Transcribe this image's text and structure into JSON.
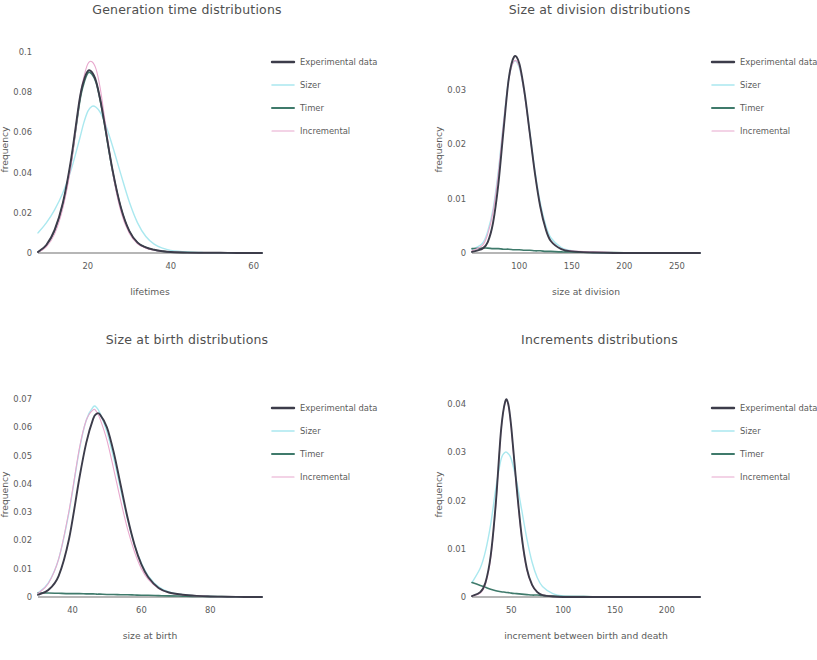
{
  "figure": {
    "series_names": [
      "Experimental data",
      "Sizer",
      "Timer",
      "Incremental"
    ],
    "colors": {
      "experimental": "#3c3c4a",
      "sizer": "#aae8ef",
      "timer": "#3f7a6b",
      "incremental": "#e8a8cd",
      "axis": "#6f6f6f",
      "text": "#5b5b5b",
      "background": "#ffffff"
    }
  },
  "panels": [
    {
      "id": "generation-time",
      "title": "Generation time distributions",
      "xlabel": "lifetimes",
      "ylabel": "frequency"
    },
    {
      "id": "size-at-division",
      "title": "Size at division distributions",
      "xlabel": "size at division",
      "ylabel": "frequency"
    },
    {
      "id": "size-at-birth",
      "title": "Size at birth distributions",
      "xlabel": "size at birth",
      "ylabel": "frequency"
    },
    {
      "id": "increments",
      "title": "Increments distributions",
      "xlabel": "increment between birth and death",
      "ylabel": "frequency"
    }
  ],
  "legend": {
    "entries": [
      {
        "label": "Experimental data",
        "color": "#3c3c4a",
        "width": 2.4
      },
      {
        "label": "Sizer",
        "color": "#aae8ef",
        "width": 1.6
      },
      {
        "label": "Timer",
        "color": "#3f7a6b",
        "width": 2.0
      },
      {
        "label": "Incremental",
        "color": "#e8a8cd",
        "width": 1.1
      }
    ]
  },
  "chart_data": [
    {
      "type": "line",
      "title": "Generation time distributions",
      "xlabel": "lifetimes",
      "ylabel": "frequency",
      "xlim": [
        8,
        62
      ],
      "ylim": [
        0,
        0.103
      ],
      "xticks": [
        20,
        40,
        60
      ],
      "yticks": [
        0,
        0.02,
        0.04,
        0.06,
        0.08,
        0.1
      ],
      "grid": false,
      "legend_position": "right",
      "x": [
        8,
        10,
        12,
        14,
        16,
        18,
        19,
        20,
        21,
        22,
        23,
        24,
        26,
        28,
        30,
        32,
        34,
        36,
        38,
        40,
        44,
        48,
        52,
        56,
        62
      ],
      "series": [
        {
          "name": "Experimental data",
          "color": "#3c3c4a",
          "values": [
            0.0005,
            0.004,
            0.0115,
            0.025,
            0.047,
            0.076,
            0.0855,
            0.0905,
            0.09,
            0.0855,
            0.0765,
            0.065,
            0.041,
            0.0225,
            0.011,
            0.0052,
            0.0028,
            0.0016,
            0.0009,
            0.0005,
            0.0002,
            0.0001,
            0.0001,
            0.0,
            0.0
          ]
        },
        {
          "name": "Sizer",
          "color": "#aae8ef",
          "values": [
            0.01,
            0.015,
            0.0215,
            0.03,
            0.0415,
            0.0565,
            0.0645,
            0.0705,
            0.073,
            0.0725,
            0.07,
            0.0655,
            0.053,
            0.039,
            0.0255,
            0.015,
            0.0082,
            0.0044,
            0.0024,
            0.0013,
            0.0005,
            0.0002,
            0.0001,
            0.0,
            0.0
          ]
        },
        {
          "name": "Timer",
          "color": "#3f7a6b",
          "values": [
            0.0004,
            0.0036,
            0.0108,
            0.024,
            0.0455,
            0.0745,
            0.084,
            0.0895,
            0.089,
            0.0848,
            0.0758,
            0.0645,
            0.0405,
            0.0222,
            0.0108,
            0.0051,
            0.0027,
            0.0015,
            0.0009,
            0.0005,
            0.0002,
            0.0001,
            0.0001,
            0.0,
            0.0
          ]
        },
        {
          "name": "Incremental",
          "color": "#e8a8cd",
          "values": [
            0.0004,
            0.003,
            0.0095,
            0.0225,
            0.044,
            0.076,
            0.087,
            0.094,
            0.0952,
            0.0915,
            0.082,
            0.068,
            0.04,
            0.0205,
            0.0098,
            0.0046,
            0.0024,
            0.0014,
            0.0008,
            0.0005,
            0.0002,
            0.0001,
            0.0001,
            0.0001,
            0.0001
          ]
        }
      ]
    },
    {
      "type": "line",
      "title": "Size at division distributions",
      "xlabel": "size at division",
      "ylabel": "frequency",
      "xlim": [
        55,
        272
      ],
      "ylim": [
        0,
        0.038
      ],
      "xticks": [
        100,
        150,
        200,
        250
      ],
      "yticks": [
        0,
        0.01,
        0.02,
        0.03
      ],
      "grid": false,
      "legend_position": "right",
      "x": [
        55,
        65,
        70,
        75,
        80,
        85,
        90,
        95,
        100,
        105,
        110,
        115,
        120,
        125,
        130,
        140,
        150,
        170,
        190,
        210,
        230,
        250,
        272
      ],
      "series": [
        {
          "name": "Experimental data",
          "color": "#3c3c4a",
          "values": [
            0.0002,
            0.0008,
            0.002,
            0.0055,
            0.0125,
            0.0225,
            0.032,
            0.036,
            0.0348,
            0.0295,
            0.022,
            0.0145,
            0.0085,
            0.0045,
            0.0022,
            0.0007,
            0.0003,
            0.0001,
            0.0,
            0.0,
            0.0,
            0.0,
            0.0
          ]
        },
        {
          "name": "Sizer",
          "color": "#aae8ef",
          "values": [
            0.0006,
            0.0018,
            0.004,
            0.008,
            0.015,
            0.024,
            0.032,
            0.0352,
            0.034,
            0.0292,
            0.0222,
            0.015,
            0.0092,
            0.0052,
            0.0028,
            0.001,
            0.0004,
            0.0001,
            0.0,
            0.0,
            0.0,
            0.0,
            0.0
          ]
        },
        {
          "name": "Timer",
          "color": "#3f7a6b",
          "values": [
            0.0008,
            0.0009,
            0.0009,
            0.0008,
            0.0008,
            0.0007,
            0.0007,
            0.0006,
            0.0006,
            0.0005,
            0.0005,
            0.0004,
            0.0004,
            0.0003,
            0.0003,
            0.0002,
            0.0002,
            0.0001,
            0.0001,
            0.0,
            0.0,
            0.0,
            0.0
          ]
        },
        {
          "name": "Incremental",
          "color": "#e8a8cd",
          "values": [
            0.0004,
            0.0014,
            0.0035,
            0.0075,
            0.0145,
            0.0238,
            0.0318,
            0.0352,
            0.0342,
            0.029,
            0.0218,
            0.0145,
            0.0086,
            0.0046,
            0.0023,
            0.0008,
            0.0004,
            0.0002,
            0.0001,
            0.0001,
            0.0001,
            0.0001,
            0.0001
          ]
        }
      ]
    },
    {
      "type": "line",
      "title": "Size at birth distributions",
      "xlabel": "size at birth",
      "ylabel": "frequency",
      "xlim": [
        30,
        95
      ],
      "ylim": [
        0,
        0.0725
      ],
      "xticks": [
        40,
        60,
        80
      ],
      "yticks": [
        0,
        0.01,
        0.02,
        0.03,
        0.04,
        0.05,
        0.06,
        0.07
      ],
      "grid": false,
      "legend_position": "right",
      "x": [
        30,
        33,
        36,
        39,
        42,
        44,
        46,
        47,
        48,
        50,
        52,
        54,
        56,
        58,
        60,
        62,
        65,
        68,
        72,
        76,
        80,
        85,
        90,
        95
      ],
      "series": [
        {
          "name": "Experimental data",
          "color": "#3c3c4a",
          "values": [
            0.0008,
            0.0025,
            0.0075,
            0.0205,
            0.042,
            0.0545,
            0.063,
            0.0648,
            0.0645,
            0.06,
            0.051,
            0.0395,
            0.028,
            0.0185,
            0.0115,
            0.007,
            0.0032,
            0.0016,
            0.0008,
            0.0004,
            0.0002,
            0.0001,
            0.0,
            0.0
          ]
        },
        {
          "name": "Sizer",
          "color": "#aae8ef",
          "values": [
            0.0015,
            0.005,
            0.0135,
            0.03,
            0.052,
            0.0625,
            0.0672,
            0.067,
            0.065,
            0.0585,
            0.049,
            0.038,
            0.0275,
            0.0185,
            0.012,
            0.0075,
            0.0036,
            0.0018,
            0.0008,
            0.0004,
            0.0002,
            0.0001,
            0.0,
            0.0
          ]
        },
        {
          "name": "Timer",
          "color": "#3f7a6b",
          "values": [
            0.0014,
            0.0014,
            0.0013,
            0.0012,
            0.0012,
            0.0011,
            0.0011,
            0.001,
            0.001,
            0.0009,
            0.0009,
            0.0008,
            0.0008,
            0.0007,
            0.0006,
            0.0006,
            0.0005,
            0.0004,
            0.0003,
            0.0002,
            0.0002,
            0.0001,
            0.0001,
            0.0
          ]
        },
        {
          "name": "Incremental",
          "color": "#e8a8cd",
          "values": [
            0.0012,
            0.0048,
            0.0135,
            0.0305,
            0.0525,
            0.0625,
            0.0662,
            0.0655,
            0.063,
            0.0555,
            0.045,
            0.034,
            0.024,
            0.016,
            0.01,
            0.0062,
            0.003,
            0.0015,
            0.0007,
            0.0004,
            0.0002,
            0.0001,
            0.0001,
            0.0001
          ]
        }
      ]
    },
    {
      "type": "line",
      "title": "Increments distributions",
      "xlabel": "increment between birth and death",
      "ylabel": "frequency",
      "xlim": [
        12,
        232
      ],
      "ylim": [
        0,
        0.0425
      ],
      "xticks": [
        50,
        100,
        150,
        200
      ],
      "yticks": [
        0,
        0.01,
        0.02,
        0.03,
        0.04
      ],
      "grid": false,
      "legend_position": "right",
      "x": [
        12,
        20,
        25,
        30,
        35,
        40,
        44,
        47,
        50,
        55,
        60,
        65,
        70,
        75,
        80,
        90,
        100,
        120,
        140,
        170,
        200,
        232
      ],
      "series": [
        {
          "name": "Experimental data",
          "color": "#3c3c4a",
          "values": [
            0.0002,
            0.001,
            0.003,
            0.0085,
            0.0195,
            0.0345,
            0.0405,
            0.04,
            0.035,
            0.023,
            0.0125,
            0.0058,
            0.0025,
            0.001,
            0.0004,
            0.0001,
            0.0,
            0.0,
            0.0,
            0.0,
            0.0,
            0.0
          ]
        },
        {
          "name": "Sizer",
          "color": "#aae8ef",
          "values": [
            0.003,
            0.006,
            0.0095,
            0.015,
            0.0225,
            0.0285,
            0.03,
            0.0297,
            0.0285,
            0.024,
            0.018,
            0.012,
            0.0072,
            0.004,
            0.0022,
            0.0007,
            0.0002,
            0.0001,
            0.0,
            0.0,
            0.0,
            0.0
          ]
        },
        {
          "name": "Timer",
          "color": "#3f7a6b",
          "values": [
            0.003,
            0.0024,
            0.002,
            0.0016,
            0.0013,
            0.0011,
            0.001,
            0.0009,
            0.0008,
            0.0007,
            0.0006,
            0.0005,
            0.0004,
            0.0004,
            0.0003,
            0.0002,
            0.0001,
            0.0001,
            0.0,
            0.0,
            0.0,
            0.0
          ]
        },
        {
          "name": "Incremental",
          "color": "#e8a8cd",
          "values": [
            0.0002,
            0.0008,
            0.0026,
            0.008,
            0.019,
            0.0345,
            0.0403,
            0.0398,
            0.0346,
            0.0225,
            0.012,
            0.0055,
            0.0024,
            0.001,
            0.0004,
            0.0001,
            0.0001,
            0.0001,
            0.0001,
            0.0001,
            0.0001,
            0.0001
          ]
        }
      ]
    }
  ]
}
